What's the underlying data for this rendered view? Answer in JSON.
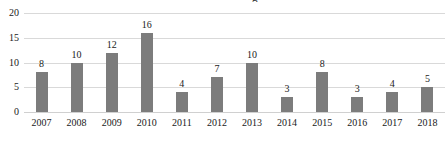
{
  "chart_data": {
    "type": "bar",
    "title": "",
    "title_cropped_remnant": "g",
    "xlabel": "",
    "ylabel": "",
    "categories": [
      "2007",
      "2008",
      "2009",
      "2010",
      "2011",
      "2012",
      "2013",
      "2014",
      "2015",
      "2016",
      "2017",
      "2018"
    ],
    "values": [
      8,
      10,
      12,
      16,
      4,
      7,
      10,
      3,
      8,
      3,
      4,
      5
    ],
    "data_labels": [
      "8",
      "10",
      "12",
      "16",
      "4",
      "7",
      "10",
      "3",
      "8",
      "3",
      "4",
      "5"
    ],
    "ylim": [
      0,
      20
    ],
    "yticks": [
      0,
      5,
      10,
      15,
      20
    ],
    "ytick_labels": [
      "0",
      "5",
      "10",
      "15",
      "20"
    ],
    "grid": true,
    "grid_axis": "y",
    "legend": false,
    "legend_position": "none",
    "series": [
      {
        "name": "",
        "values": [
          8,
          10,
          12,
          16,
          4,
          7,
          10,
          3,
          8,
          3,
          4,
          5
        ]
      }
    ],
    "colors": {
      "bar": "#7c7c7c",
      "grid": "#d9d9d9",
      "baseline": "#d0d0d0",
      "text": "#1a1a1a",
      "background": "#ffffff"
    }
  }
}
